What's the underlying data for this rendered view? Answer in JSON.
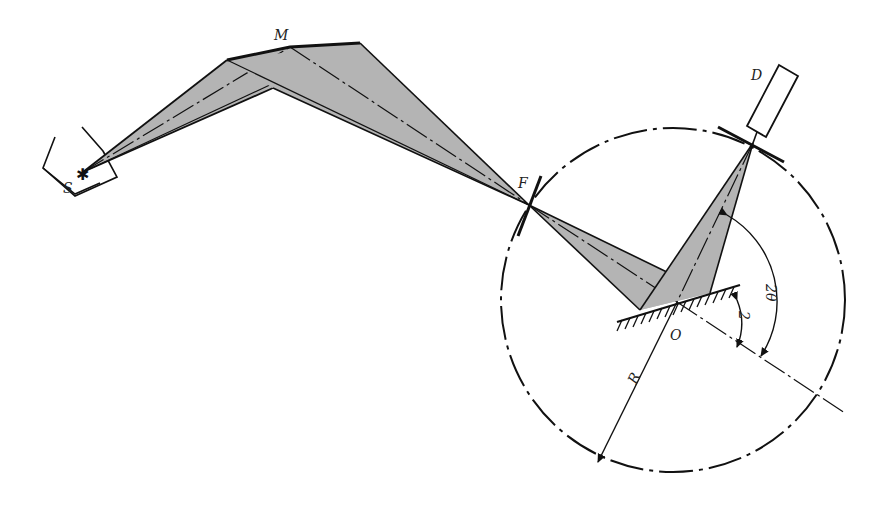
{
  "diagram": {
    "type": "Rowland circle spectrometer geometry",
    "labels": {
      "source": "S",
      "mirror": "M",
      "focus": "F",
      "detector": "D",
      "center": "O",
      "radius": "R",
      "angle_theta": "2",
      "angle_two_theta": "2θ"
    },
    "colors": {
      "beam_fill": "#b4b4b4",
      "line": "#111111",
      "background": "#ffffff"
    },
    "points": {
      "S": [
        83,
        172
      ],
      "M_left": [
        227,
        60
      ],
      "M_mid": [
        290,
        47
      ],
      "M_right": [
        360,
        43
      ],
      "M_lower": [
        273,
        88
      ],
      "F": [
        529,
        205
      ],
      "O": [
        677,
        302
      ],
      "crystal_left": [
        640,
        310
      ],
      "crystal_right": [
        710,
        293
      ],
      "D_focus": [
        753,
        143
      ]
    },
    "circle": {
      "cx": 673,
      "cy": 300,
      "r": 172
    }
  }
}
